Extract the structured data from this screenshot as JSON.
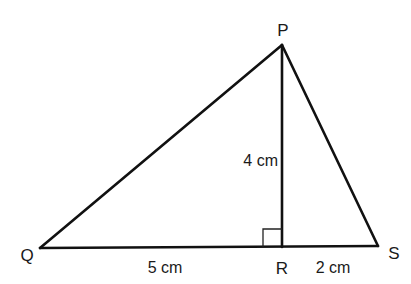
{
  "diagram": {
    "type": "geometry-triangle",
    "vertices": {
      "P": {
        "label": "P",
        "x": 282,
        "y": 45
      },
      "Q": {
        "label": "Q",
        "x": 40,
        "y": 248
      },
      "R": {
        "label": "R",
        "x": 282,
        "y": 247
      },
      "S": {
        "label": "S",
        "x": 378,
        "y": 246
      }
    },
    "segments": [
      {
        "from": "Q",
        "to": "P"
      },
      {
        "from": "P",
        "to": "S"
      },
      {
        "from": "Q",
        "to": "S"
      },
      {
        "from": "P",
        "to": "R"
      }
    ],
    "right_angle_at": "R",
    "measurements": {
      "QR": "5 cm",
      "RS": "2 cm",
      "PR": "4 cm"
    },
    "line_color": "#111111",
    "background": "#ffffff"
  }
}
